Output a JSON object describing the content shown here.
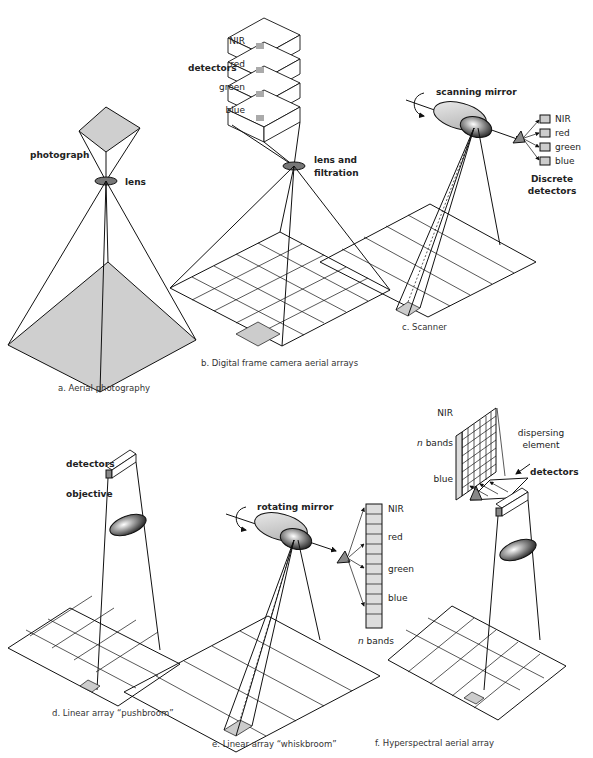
{
  "panels": {
    "a": {
      "caption": "a. Aerial photography",
      "labels": {
        "photograph": "photograph",
        "lens": "lens"
      }
    },
    "b": {
      "caption": "b. Digital frame camera aerial arrays",
      "labels": {
        "detectors": "detectors",
        "bands": [
          "NIR",
          "red",
          "green",
          "blue"
        ],
        "lens_line1": "lens and",
        "lens_line2": "filtration"
      }
    },
    "c": {
      "caption": "c. Scanner",
      "labels": {
        "mirror": "scanning mirror",
        "bands": [
          "NIR",
          "red",
          "green",
          "blue"
        ],
        "detectors_line1": "Discrete",
        "detectors_line2": "detectors"
      }
    },
    "d": {
      "caption": "d. Linear array “pushbroom”",
      "labels": {
        "detectors": "detectors",
        "objective": "objective"
      }
    },
    "e": {
      "caption": "e. Linear array “whiskbroom”",
      "labels": {
        "mirror": "rotating mirror",
        "bands": [
          "NIR",
          "red",
          "green",
          "blue"
        ],
        "n_bands_italic": "n",
        "n_bands_rest": " bands"
      }
    },
    "f": {
      "caption": "f. Hyperspectral aerial array",
      "labels": {
        "nir": "NIR",
        "n_bands_italic": "n",
        "n_bands_rest": " bands",
        "blue": "blue",
        "dispersing_line1": "dispersing",
        "dispersing_line2": "element",
        "detectors": "detectors"
      }
    }
  }
}
